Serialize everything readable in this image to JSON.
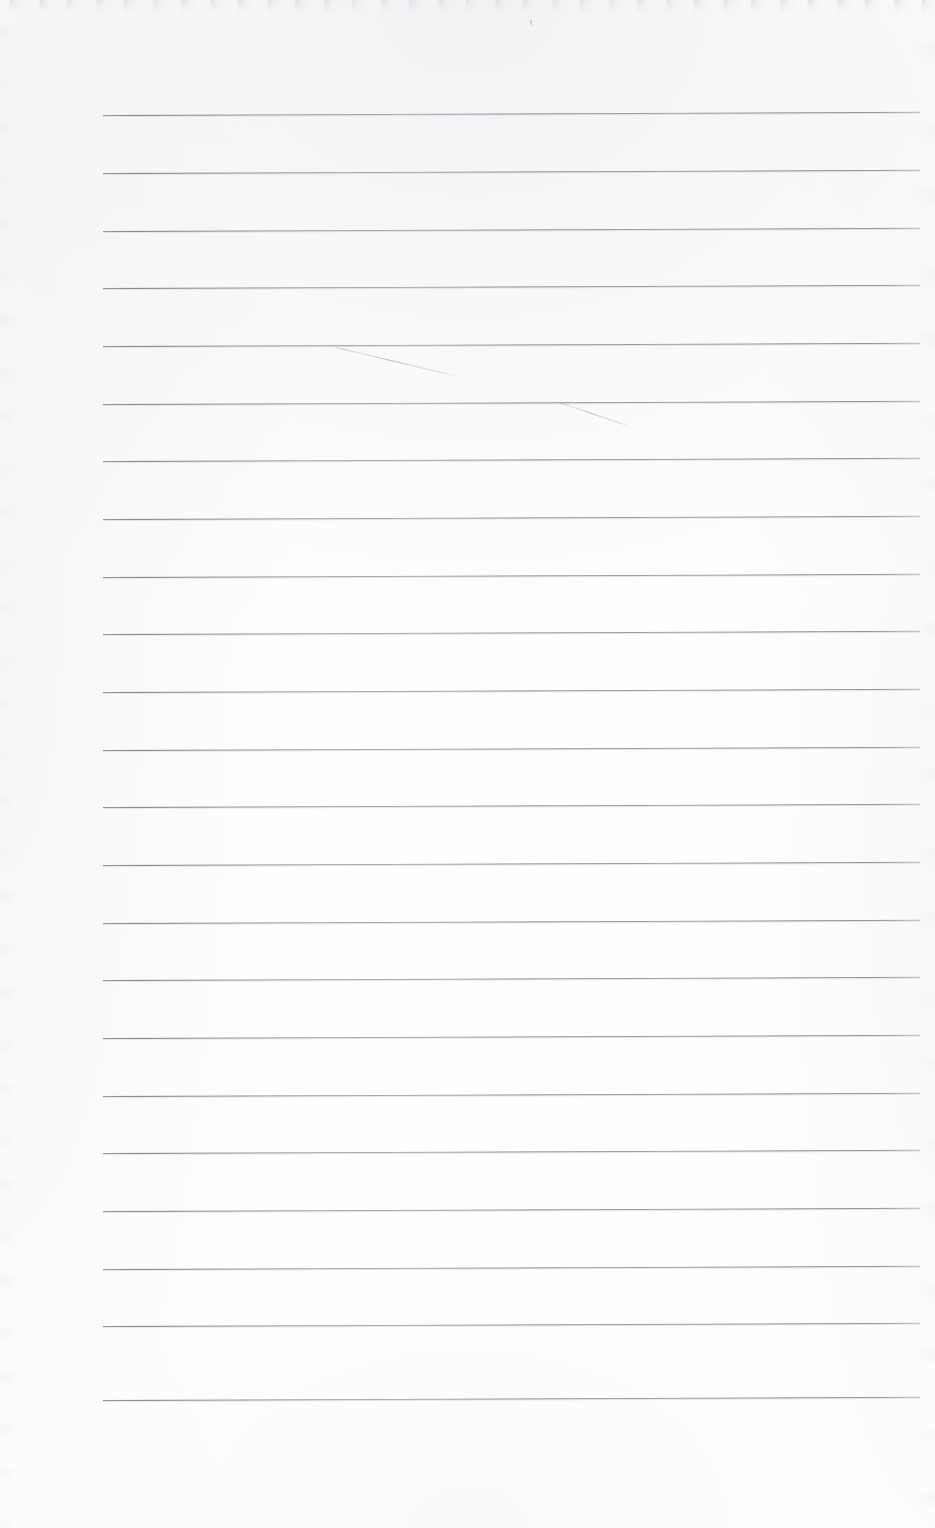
{
  "document": {
    "type": "scanned-lined-notebook-page",
    "title": "Blank Lined Page",
    "caption": "Scanned blank ruled notebook page with no written text",
    "page_width": 935,
    "page_height": 1528,
    "background_color": "#fefefe",
    "has_text_content": false,
    "written_text": ""
  },
  "ruling": {
    "line_color": "#83868c",
    "line_count": 23,
    "left_x": 103,
    "right_x": 920,
    "first_line_y": 115,
    "line_spacing": 57.7,
    "rotation_deg": -0.22,
    "line_y_positions": [
      115,
      173,
      231,
      288,
      346,
      404,
      461,
      519,
      577,
      634,
      692,
      750,
      807,
      865,
      923,
      980,
      1038,
      1096,
      1153,
      1211,
      1269,
      1326,
      1400
    ]
  },
  "marks": {
    "label": "faint pencil strokes",
    "color": "#a0a2a8",
    "strokes": [
      {
        "name": "pencil-stroke-upper",
        "x1": 332,
        "y1": 346,
        "x2": 458,
        "y2": 376
      },
      {
        "name": "pencil-stroke-lower",
        "x1": 556,
        "y1": 401,
        "x2": 630,
        "y2": 426
      }
    ]
  },
  "artifacts": {
    "speck": {
      "x": 530,
      "y": 20,
      "label": "paper-speck"
    },
    "top_edge_shadow": true,
    "left_edge_shadow": true,
    "right_edge_shadow": true
  },
  "margins": {
    "top": 115,
    "bottom": 128,
    "left": 103,
    "right": 15
  }
}
